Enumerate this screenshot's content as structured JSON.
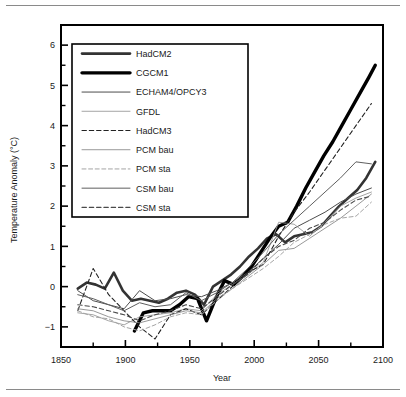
{
  "figure": {
    "background": "#ffffff",
    "frame_color": "#000000",
    "rules": [
      "top-rule",
      "bottom-rule"
    ]
  },
  "chart_data": {
    "type": "line",
    "title": "",
    "xlabel": "Year",
    "ylabel": "Temperature Anomaly (°C)",
    "xlim": [
      1850,
      2100
    ],
    "ylim": [
      -1.5,
      6.5
    ],
    "xticks": [
      1850,
      1900,
      1950,
      2000,
      2050,
      2100
    ],
    "xtick_labels": [
      "1850",
      "1900",
      "1950",
      "2000",
      "2050",
      "2100"
    ],
    "xticks_minor": [
      1875,
      1925,
      1975,
      2025,
      2075
    ],
    "yticks": [
      -1,
      0,
      1,
      2,
      3,
      4,
      5,
      6
    ],
    "ytick_labels": [
      "−1",
      "0",
      "1",
      "2",
      "3",
      "4",
      "5",
      "6"
    ],
    "yticks_minor": [
      -1.5,
      -0.5,
      0.5,
      1.5,
      2.5,
      3.5,
      4.5,
      5.5,
      6.5
    ],
    "grid": false,
    "legend_position": "upper-left",
    "series": [
      {
        "name": "HadCM2",
        "style": "solid",
        "color": "#333333",
        "width": 2.6,
        "x": [
          1863,
          1870,
          1877,
          1884,
          1891,
          1898,
          1905,
          1912,
          1919,
          1926,
          1933,
          1940,
          1947,
          1954,
          1961,
          1968,
          1975,
          1982,
          1989,
          1996,
          2003,
          2010,
          2017,
          2024,
          2031,
          2038,
          2045,
          2052,
          2059,
          2066,
          2073,
          2080,
          2087,
          2094
        ],
        "y": [
          -0.05,
          0.1,
          0.05,
          -0.05,
          0.35,
          -0.1,
          -0.35,
          -0.3,
          -0.35,
          -0.4,
          -0.3,
          -0.15,
          -0.1,
          -0.2,
          -0.45,
          0.0,
          0.15,
          0.3,
          0.5,
          0.75,
          0.95,
          1.2,
          1.3,
          1.1,
          1.25,
          1.3,
          1.35,
          1.5,
          1.75,
          2.0,
          2.2,
          2.4,
          2.7,
          3.1
        ]
      },
      {
        "name": "CGCM1",
        "style": "solid",
        "color": "#000000",
        "width": 3.4,
        "x": [
          1907,
          1914,
          1921,
          1928,
          1935,
          1942,
          1949,
          1956,
          1963,
          1970,
          1977,
          1984,
          1991,
          1998,
          2005,
          2012,
          2019,
          2026,
          2033,
          2040,
          2047,
          2054,
          2061,
          2068,
          2075,
          2082,
          2089,
          2094
        ],
        "y": [
          -1.1,
          -0.65,
          -0.6,
          -0.6,
          -0.6,
          -0.45,
          -0.25,
          -0.3,
          -0.85,
          -0.3,
          0.15,
          0.05,
          0.25,
          0.5,
          0.85,
          1.2,
          1.5,
          1.6,
          2.0,
          2.45,
          2.85,
          3.25,
          3.6,
          4.0,
          4.4,
          4.8,
          5.2,
          5.5
        ]
      },
      {
        "name": "ECHAM4/OPCY3",
        "style": "solid",
        "color": "#4d4d4d",
        "width": 1.0,
        "x": [
          1863,
          1875,
          1887,
          1899,
          1911,
          1923,
          1935,
          1947,
          1959,
          1971,
          1983,
          1995,
          2007,
          2019,
          2031,
          2043,
          2055,
          2067,
          2079,
          2091
        ],
        "y": [
          -0.1,
          -0.35,
          -0.45,
          -0.55,
          -0.1,
          -0.35,
          -0.3,
          -0.2,
          -0.25,
          -0.1,
          0.1,
          0.35,
          0.7,
          1.05,
          1.45,
          1.65,
          1.85,
          2.1,
          2.3,
          2.45
        ]
      },
      {
        "name": "GFDL",
        "style": "solid",
        "color": "#9a9a9a",
        "width": 0.9,
        "x": [
          1863,
          1875,
          1887,
          1899,
          1911,
          1923,
          1935,
          1947,
          1959,
          1971,
          1983,
          1995,
          2007,
          2019,
          2031,
          2043,
          2055,
          2067,
          2079,
          2091
        ],
        "y": [
          -0.65,
          -0.7,
          -0.85,
          -0.95,
          -0.75,
          -0.7,
          -0.65,
          -0.55,
          -0.6,
          -0.2,
          0.05,
          0.3,
          0.6,
          1.6,
          1.55,
          1.25,
          1.6,
          2.0,
          2.2,
          2.35
        ]
      },
      {
        "name": "HadCM3",
        "style": "dashed",
        "color": "#222222",
        "width": 1.1,
        "x": [
          1863,
          1875,
          1887,
          1899,
          1911,
          1923,
          1935,
          1947,
          1959,
          1971,
          1983,
          1995,
          2007,
          2019,
          2031,
          2043,
          2055,
          2067,
          2079,
          2091
        ],
        "y": [
          -0.6,
          0.45,
          -0.2,
          -0.6,
          -1.0,
          -1.3,
          -0.7,
          -0.55,
          -0.7,
          -0.35,
          0.0,
          0.35,
          0.55,
          1.25,
          1.85,
          2.35,
          2.9,
          3.45,
          4.0,
          4.55
        ]
      },
      {
        "name": "PCM bau",
        "style": "solid",
        "color": "#8c8c8c",
        "width": 0.9,
        "x": [
          1863,
          1875,
          1887,
          1899,
          1911,
          1923,
          1935,
          1947,
          1959,
          1971,
          1983,
          1995,
          2007,
          2019,
          2031,
          2043,
          2055,
          2067,
          2079,
          2091
        ],
        "y": [
          -0.55,
          -0.6,
          -0.75,
          -0.85,
          -0.9,
          -0.8,
          -0.7,
          -0.6,
          -0.65,
          -0.3,
          -0.05,
          0.25,
          0.55,
          0.9,
          0.95,
          1.2,
          1.45,
          1.7,
          2.0,
          2.3
        ]
      },
      {
        "name": "PCM sta",
        "style": "dashed",
        "color": "#a5a5a5",
        "width": 1.0,
        "x": [
          1863,
          1875,
          1887,
          1899,
          1911,
          1923,
          1935,
          1947,
          1959,
          1971,
          1983,
          1995,
          2007,
          2019,
          2031,
          2043,
          2055,
          2067,
          2079,
          2091
        ],
        "y": [
          -0.6,
          -0.75,
          -0.8,
          -1.0,
          -1.1,
          -0.95,
          -0.75,
          -0.65,
          -0.7,
          -0.35,
          -0.05,
          0.2,
          0.45,
          0.75,
          1.1,
          1.3,
          1.55,
          1.7,
          1.75,
          2.1
        ]
      },
      {
        "name": "CSM bau",
        "style": "solid",
        "color": "#5f5f5f",
        "width": 1.0,
        "x": [
          1863,
          1875,
          1887,
          1899,
          1911,
          1923,
          1935,
          1947,
          1959,
          1971,
          1983,
          1995,
          2007,
          2019,
          2031,
          2043,
          2055,
          2067,
          2079,
          2091
        ],
        "y": [
          -0.2,
          -0.3,
          -0.45,
          -0.6,
          -0.4,
          -0.5,
          -0.45,
          -0.15,
          -0.35,
          -0.15,
          0.1,
          0.45,
          0.85,
          1.3,
          1.65,
          2.0,
          2.35,
          2.7,
          3.1,
          3.05
        ]
      },
      {
        "name": "CSM sta",
        "style": "dashed",
        "color": "#4a4a4a",
        "width": 1.1,
        "x": [
          1863,
          1875,
          1887,
          1899,
          1911,
          1923,
          1935,
          1947,
          1959,
          1971,
          1983,
          1995,
          2007,
          2019,
          2031,
          2043,
          2055,
          2067,
          2079,
          2091
        ],
        "y": [
          -0.45,
          -0.5,
          -0.6,
          -0.7,
          -0.85,
          -0.7,
          -0.6,
          -0.45,
          -0.55,
          -0.25,
          0.05,
          0.3,
          0.7,
          1.0,
          1.15,
          1.45,
          1.6,
          1.9,
          2.15,
          2.25
        ]
      }
    ]
  }
}
